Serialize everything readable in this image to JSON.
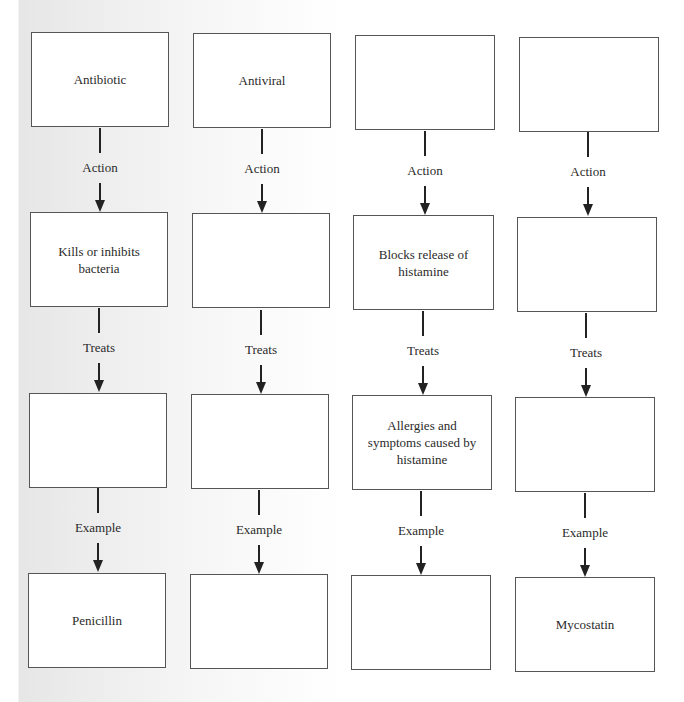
{
  "diagram": {
    "columns": [
      {
        "drug_class": "Antibiotic",
        "action": "Kills or inhibits bacteria",
        "treats": "",
        "example": "Penicillin"
      },
      {
        "drug_class": "Antiviral",
        "action": "",
        "treats": "",
        "example": ""
      },
      {
        "drug_class": "",
        "action": "Blocks release of histamine",
        "treats": "Allergies and symptoms caused by histamine",
        "example": ""
      },
      {
        "drug_class": "",
        "action": "",
        "treats": "",
        "example": "Mycostatin"
      }
    ],
    "connector_labels": {
      "action": "Action",
      "treats": "Treats",
      "example": "Example"
    }
  }
}
